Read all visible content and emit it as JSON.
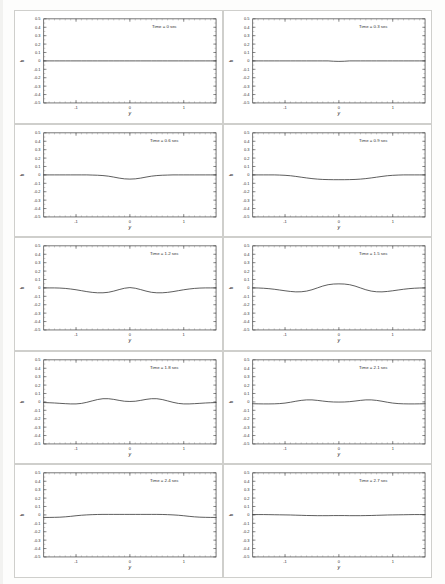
{
  "document": {
    "kind": "scanned-figure-page",
    "background_color": "#fdfdfc",
    "panel_border_color": "#cfcfcc",
    "line_color": "#333333"
  },
  "chart_data": {
    "type": "line",
    "title": "",
    "xlabel": "y",
    "ylabel": "h",
    "xlim": [
      -1.6,
      1.6
    ],
    "ylim": [
      -0.5,
      0.5
    ],
    "xticks": [
      -1,
      0,
      1
    ],
    "xtick_labels": [
      "-1",
      "0",
      "1"
    ],
    "yticks": [
      0.5,
      0.4,
      0.3,
      0.2,
      0.1,
      0,
      -0.1,
      -0.2,
      -0.3,
      -0.4,
      -0.5
    ],
    "ytick_labels": [
      "0.5",
      "0.4",
      "0.3",
      "0.2",
      "0.1",
      "0",
      "-0.1",
      "-0.2",
      "-0.3",
      "-0.4",
      "-0.5"
    ],
    "grid": false,
    "legend": "none",
    "minor_ticks": true,
    "layout": {
      "rows": 5,
      "cols": 2,
      "order": "row-major"
    },
    "x": [
      -1.6,
      -1.5,
      -1.4,
      -1.3,
      -1.2,
      -1.1,
      -1.0,
      -0.9,
      -0.8,
      -0.7,
      -0.6,
      -0.5,
      -0.4,
      -0.3,
      -0.2,
      -0.1,
      0.0,
      0.1,
      0.2,
      0.3,
      0.4,
      0.5,
      0.6,
      0.7,
      0.8,
      0.9,
      1.0,
      1.1,
      1.2,
      1.3,
      1.4,
      1.5,
      1.6
    ],
    "panels": [
      {
        "id": "panel-1",
        "annotation": "Time = 0 sec",
        "time_value": 0.0,
        "values": [
          0,
          0,
          0,
          0,
          0,
          0,
          0,
          0,
          0,
          0,
          0,
          0,
          0,
          0,
          0,
          0,
          0,
          0,
          0,
          0,
          0,
          0,
          0,
          0,
          0,
          0,
          0,
          0,
          0,
          0,
          0,
          0,
          0
        ]
      },
      {
        "id": "panel-2",
        "annotation": "Time = 0.3 sec",
        "time_value": 0.3,
        "values": [
          0,
          0,
          0,
          0,
          0,
          0,
          0,
          0,
          0,
          0,
          0,
          0,
          0,
          0,
          0,
          -0.004,
          -0.006,
          -0.004,
          0,
          0,
          0,
          0,
          0,
          0,
          0,
          0,
          0,
          0,
          0,
          0,
          0,
          0,
          0
        ]
      },
      {
        "id": "panel-3",
        "annotation": "Time = 0.6 sec",
        "time_value": 0.6,
        "values": [
          0,
          0,
          0,
          0,
          0,
          0,
          0,
          0,
          0,
          -0.002,
          -0.004,
          -0.008,
          -0.015,
          -0.026,
          -0.038,
          -0.047,
          -0.05,
          -0.047,
          -0.038,
          -0.026,
          -0.015,
          -0.008,
          -0.004,
          -0.002,
          0,
          0,
          0,
          0,
          0,
          0,
          0,
          0,
          0
        ]
      },
      {
        "id": "panel-4",
        "annotation": "Time = 0.9 sec",
        "time_value": 0.9,
        "values": [
          0,
          0,
          0,
          0,
          0,
          -0.002,
          -0.005,
          -0.01,
          -0.018,
          -0.027,
          -0.036,
          -0.044,
          -0.05,
          -0.054,
          -0.056,
          -0.057,
          -0.057,
          -0.057,
          -0.056,
          -0.054,
          -0.05,
          -0.044,
          -0.036,
          -0.027,
          -0.018,
          -0.01,
          -0.005,
          -0.002,
          0,
          0,
          0,
          0,
          0
        ]
      },
      {
        "id": "panel-5",
        "annotation": "Time = 1.2 sec",
        "time_value": 1.2,
        "values": [
          0,
          0,
          0,
          -0.002,
          -0.006,
          -0.013,
          -0.022,
          -0.033,
          -0.044,
          -0.053,
          -0.058,
          -0.058,
          -0.052,
          -0.038,
          -0.02,
          -0.004,
          0.004,
          -0.004,
          -0.02,
          -0.038,
          -0.052,
          -0.058,
          -0.058,
          -0.053,
          -0.044,
          -0.033,
          -0.022,
          -0.013,
          -0.006,
          -0.002,
          0,
          0,
          0
        ]
      },
      {
        "id": "panel-6",
        "annotation": "Time = 1.5 sec",
        "time_value": 1.5,
        "values": [
          0,
          -0.001,
          -0.004,
          -0.009,
          -0.016,
          -0.025,
          -0.034,
          -0.042,
          -0.047,
          -0.046,
          -0.038,
          -0.022,
          0.0,
          0.022,
          0.038,
          0.046,
          0.048,
          0.046,
          0.038,
          0.022,
          0.0,
          -0.022,
          -0.038,
          -0.046,
          -0.047,
          -0.042,
          -0.034,
          -0.025,
          -0.016,
          -0.009,
          -0.004,
          -0.001,
          0
        ]
      },
      {
        "id": "panel-7",
        "annotation": "Time = 1.8 sec",
        "time_value": 1.8,
        "values": [
          -0.008,
          -0.01,
          -0.013,
          -0.017,
          -0.021,
          -0.024,
          -0.024,
          -0.018,
          -0.005,
          0.012,
          0.028,
          0.038,
          0.038,
          0.03,
          0.018,
          0.008,
          0.005,
          0.008,
          0.018,
          0.03,
          0.038,
          0.038,
          0.028,
          0.012,
          -0.005,
          -0.018,
          -0.024,
          -0.024,
          -0.021,
          -0.017,
          -0.013,
          -0.01,
          -0.008
        ]
      },
      {
        "id": "panel-8",
        "annotation": "Time = 2.1 sec",
        "time_value": 2.1,
        "values": [
          -0.022,
          -0.023,
          -0.024,
          -0.024,
          -0.023,
          -0.02,
          -0.014,
          -0.004,
          0.008,
          0.018,
          0.024,
          0.024,
          0.018,
          0.01,
          0.003,
          -0.001,
          -0.002,
          -0.001,
          0.003,
          0.01,
          0.018,
          0.024,
          0.024,
          0.018,
          0.008,
          -0.004,
          -0.014,
          -0.02,
          -0.023,
          -0.024,
          -0.024,
          -0.023,
          -0.022
        ]
      },
      {
        "id": "panel-9",
        "annotation": "Time = 2.4 sec",
        "time_value": 2.4,
        "values": [
          -0.03,
          -0.03,
          -0.029,
          -0.027,
          -0.023,
          -0.017,
          -0.01,
          -0.004,
          0.0,
          0.003,
          0.005,
          0.006,
          0.006,
          0.006,
          0.006,
          0.006,
          0.006,
          0.006,
          0.006,
          0.006,
          0.006,
          0.006,
          0.005,
          0.003,
          0.0,
          -0.004,
          -0.01,
          -0.017,
          -0.023,
          -0.027,
          -0.029,
          -0.03,
          -0.03
        ]
      },
      {
        "id": "panel-10",
        "annotation": "Time = 2.7 sec",
        "time_value": 2.7,
        "values": [
          0.004,
          0.004,
          0.004,
          0.003,
          0.002,
          0.001,
          0.0,
          -0.001,
          -0.003,
          -0.005,
          -0.007,
          -0.008,
          -0.009,
          -0.009,
          -0.009,
          -0.008,
          -0.008,
          -0.008,
          -0.009,
          -0.009,
          -0.009,
          -0.008,
          -0.007,
          -0.005,
          -0.003,
          -0.001,
          0.0,
          0.001,
          0.002,
          0.003,
          0.004,
          0.004,
          0.004
        ]
      }
    ]
  }
}
